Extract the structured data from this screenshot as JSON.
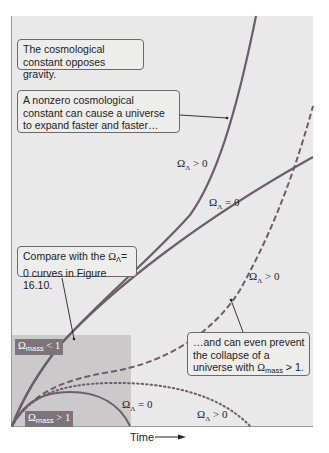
{
  "figure": {
    "x_axis_label": "Time",
    "callouts": {
      "gravity": "The cosmological constant opposes gravity.",
      "expand": "A nonzero cosmological constant can cause a universe to expand faster and faster…",
      "compare_prefix": "Compare with the ",
      "compare_symbol": "Ω",
      "compare_sub": "Λ",
      "compare_suffix": "= 0 curves in Figure 16.10.",
      "prevent_line1": "…and can even prevent the collapse of a universe with ",
      "prevent_symbol": "Ω",
      "prevent_sub": "mass",
      "prevent_suffix": " > 1."
    },
    "region_tags": [
      {
        "symbol": "Ω",
        "sub": "mass",
        "rel": " < 1"
      },
      {
        "symbol": "Ω",
        "sub": "mass",
        "rel": " > 1"
      }
    ],
    "curve_labels": [
      {
        "symbol": "Ω",
        "sub": "Λ",
        "rel": " > 0"
      },
      {
        "symbol": "Ω",
        "sub": "Λ",
        "rel": " = 0"
      },
      {
        "symbol": "Ω",
        "sub": "Λ",
        "rel": " > 0"
      },
      {
        "symbol": "Ω",
        "sub": "Λ",
        "rel": " = 0"
      },
      {
        "symbol": "Ω",
        "sub": "Λ",
        "rel": " > 0"
      }
    ],
    "colors": {
      "plot_bg": "#e9e9e9",
      "region_shade": "#c9c7c8",
      "curve": "#6b5f6a",
      "tag_bg": "#7d7479"
    }
  }
}
